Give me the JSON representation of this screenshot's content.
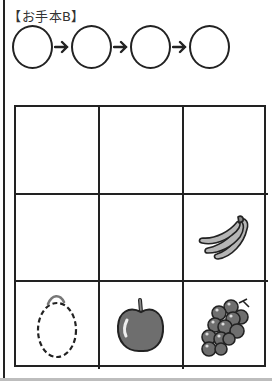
{
  "title": "【お手本B】",
  "sequence": {
    "slots": 4,
    "connector": "arrow-right"
  },
  "grid": {
    "rows": 3,
    "columns": 3,
    "cells": [
      [
        "empty",
        "empty",
        "empty"
      ],
      [
        "empty",
        "empty",
        "banana-icon"
      ],
      [
        "lemon-outline-dashed-icon",
        "apple-icon",
        "grapes-icon"
      ]
    ]
  },
  "colors": {
    "line": "#222222",
    "fruit_fill": "#7a7a7a",
    "banana_fill": "#b5b5b5"
  }
}
